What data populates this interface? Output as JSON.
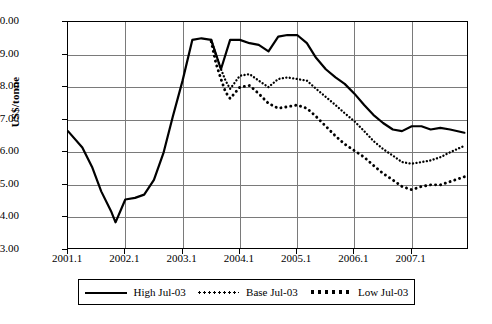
{
  "chart_data": {
    "type": "line",
    "title": "",
    "xlabel": "",
    "ylabel": "US$/tonne",
    "ylim": [
      3.0,
      10.0
    ],
    "ytick_labels": [
      "10.00",
      "9.00",
      "8.00",
      "7.00",
      "6.00",
      "5.00",
      "4.00",
      "3.00"
    ],
    "ytick_values": [
      10.0,
      9.0,
      8.0,
      7.0,
      6.0,
      5.0,
      4.0,
      3.0
    ],
    "xtick_labels": [
      "2001.1",
      "2002.1",
      "2003.1",
      "2004.1",
      "2005.1",
      "2006.1",
      "2007.1"
    ],
    "xtick_values": [
      2001.0,
      2002.0,
      2003.0,
      2004.0,
      2005.0,
      2006.0,
      2007.0
    ],
    "xlim": [
      2001.0,
      2008.0
    ],
    "grid": true,
    "legend_position": "bottom",
    "series": [
      {
        "name": "High Jul-03",
        "style": "solid",
        "x": [
          2001.0,
          2001.25,
          2001.42,
          2001.58,
          2001.75,
          2001.83,
          2002.0,
          2002.17,
          2002.33,
          2002.5,
          2002.67,
          2002.83,
          2003.0,
          2003.17,
          2003.33,
          2003.5,
          2003.67,
          2003.83,
          2004.0,
          2004.17,
          2004.33,
          2004.5,
          2004.67,
          2004.83,
          2005.0,
          2005.17,
          2005.33,
          2005.5,
          2005.67,
          2005.83,
          2006.0,
          2006.17,
          2006.33,
          2006.5,
          2006.67,
          2006.83,
          2007.0,
          2007.17,
          2007.33,
          2007.5,
          2007.67,
          2007.92
        ],
        "values": [
          6.65,
          6.15,
          5.55,
          4.8,
          4.2,
          3.85,
          4.55,
          4.6,
          4.7,
          5.15,
          6.0,
          7.1,
          8.2,
          9.45,
          9.5,
          9.45,
          8.55,
          9.45,
          9.45,
          9.35,
          9.3,
          9.1,
          9.55,
          9.6,
          9.6,
          9.35,
          8.9,
          8.55,
          8.3,
          8.1,
          7.8,
          7.45,
          7.15,
          6.9,
          6.7,
          6.65,
          6.8,
          6.8,
          6.7,
          6.75,
          6.7,
          6.6
        ]
      },
      {
        "name": "Base Jul-03",
        "style": "dotted-fine",
        "x": [
          2003.5,
          2003.58,
          2003.67,
          2003.75,
          2003.83,
          2004.0,
          2004.17,
          2004.33,
          2004.5,
          2004.67,
          2004.83,
          2005.0,
          2005.17,
          2005.33,
          2005.5,
          2005.67,
          2005.83,
          2006.0,
          2006.17,
          2006.33,
          2006.5,
          2006.67,
          2006.83,
          2007.0,
          2007.17,
          2007.33,
          2007.5,
          2007.67,
          2007.92
        ],
        "values": [
          9.45,
          9.0,
          8.55,
          8.2,
          7.95,
          8.35,
          8.4,
          8.2,
          8.0,
          8.25,
          8.3,
          8.25,
          8.2,
          7.95,
          7.7,
          7.45,
          7.2,
          6.95,
          6.65,
          6.35,
          6.1,
          5.9,
          5.7,
          5.65,
          5.7,
          5.75,
          5.85,
          6.0,
          6.2
        ]
      },
      {
        "name": "Low Jul-03",
        "style": "dotted-coarse",
        "x": [
          2003.5,
          2003.58,
          2003.67,
          2003.75,
          2003.83,
          2004.0,
          2004.17,
          2004.33,
          2004.5,
          2004.67,
          2004.83,
          2005.0,
          2005.17,
          2005.33,
          2005.5,
          2005.67,
          2005.83,
          2006.0,
          2006.17,
          2006.33,
          2006.5,
          2006.67,
          2006.83,
          2007.0,
          2007.17,
          2007.33,
          2007.5,
          2007.67,
          2007.92
        ],
        "values": [
          9.4,
          8.75,
          8.25,
          7.85,
          7.65,
          8.0,
          8.05,
          7.8,
          7.5,
          7.35,
          7.4,
          7.45,
          7.35,
          7.1,
          6.8,
          6.5,
          6.25,
          6.05,
          5.85,
          5.6,
          5.35,
          5.15,
          4.95,
          4.85,
          4.95,
          5.0,
          5.0,
          5.1,
          5.25
        ]
      }
    ]
  },
  "axis": {
    "y_label": "US$/tonne"
  },
  "legend": {
    "items": [
      {
        "label": "High Jul-03"
      },
      {
        "label": "Base Jul-03"
      },
      {
        "label": "Low Jul-03"
      }
    ]
  }
}
